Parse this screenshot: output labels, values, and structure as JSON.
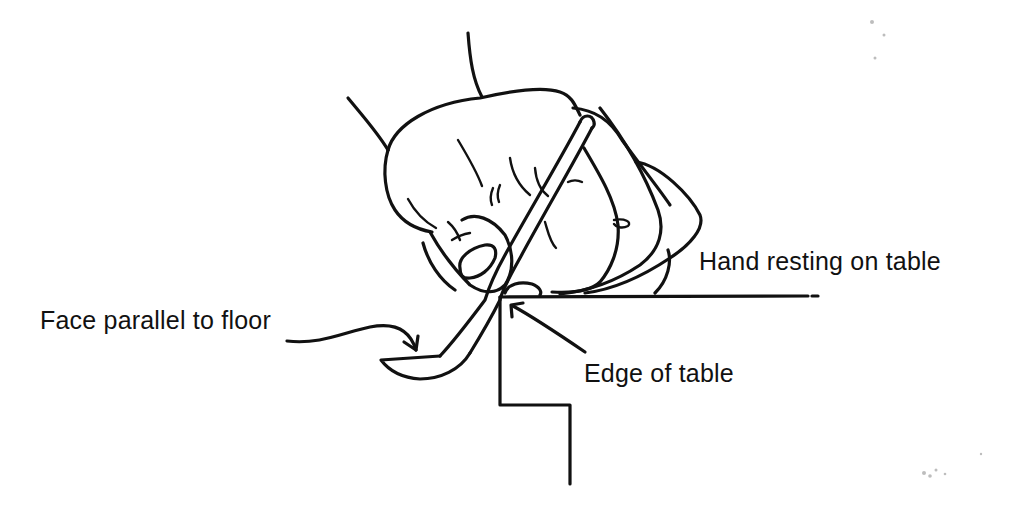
{
  "figure": {
    "type": "instructional line drawing",
    "colors": {
      "background": "#ffffff",
      "ink": "#111111"
    }
  },
  "labels": {
    "hand_resting": "Hand resting on table",
    "face_parallel": "Face parallel to floor",
    "edge_of_table": "Edge of table"
  },
  "callouts": [
    {
      "label_key": "face_parallel",
      "points_to": "instrument face/blade"
    },
    {
      "label_key": "edge_of_table",
      "points_to": "table corner"
    },
    {
      "label_key": "hand_resting",
      "points_to": "table surface line"
    }
  ]
}
